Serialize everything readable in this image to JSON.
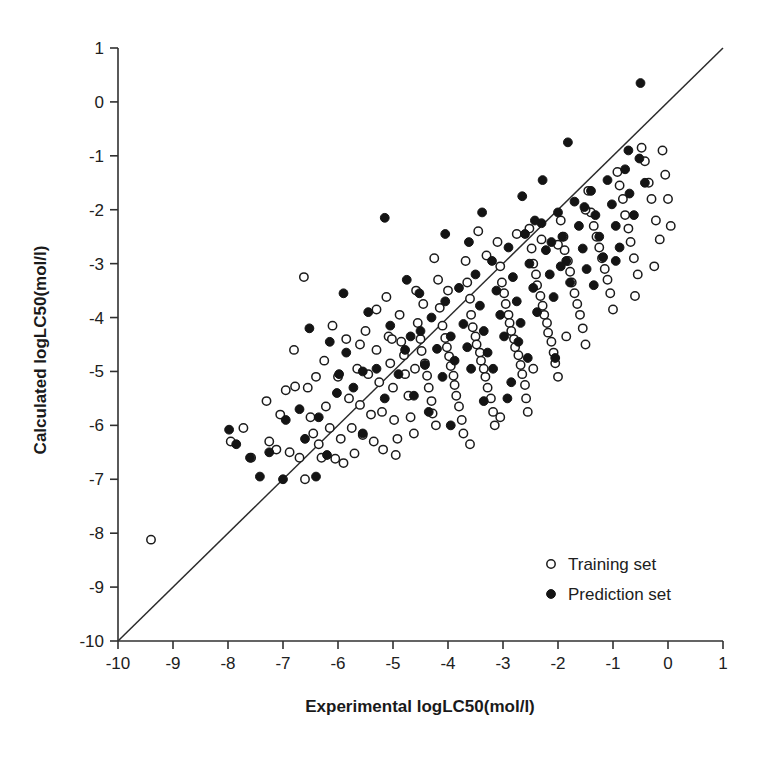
{
  "chart_data": {
    "type": "scatter",
    "title": "",
    "xlabel": "Experimental logLC50(mol/l)",
    "ylabel": "Calculated logLC50(mol/l)",
    "xlim": [
      -10,
      1
    ],
    "ylim": [
      -10,
      1
    ],
    "xticks": [
      -10,
      -9,
      -8,
      -7,
      -6,
      -5,
      -4,
      -3,
      -2,
      -1,
      0,
      1
    ],
    "yticks": [
      1,
      0,
      -1,
      -2,
      -3,
      -4,
      -5,
      -6,
      -7,
      -8,
      -9,
      -10
    ],
    "xtick_labels": [
      "-10",
      "-9",
      "-8",
      "-7",
      "-6",
      "-5",
      "-4",
      "-3",
      "-2",
      "-1",
      "0",
      "1"
    ],
    "ytick_labels": [
      "1",
      "0",
      "-1",
      "-2",
      "-3",
      "-4",
      "-5",
      "-6",
      "-7",
      "-8",
      "-9",
      "-10"
    ],
    "grid": false,
    "legend_position": "lower-right",
    "reference_line": {
      "name": "identity-line",
      "from": [
        -10,
        -10
      ],
      "to": [
        1,
        1
      ],
      "color": "#2b2b2b"
    },
    "series": [
      {
        "name": "Training set",
        "marker": "open-circle",
        "color": "#ffffff",
        "edge_color": "#1b1b1b",
        "points": [
          [
            -9.4,
            -8.12
          ],
          [
            -7.95,
            -6.3
          ],
          [
            -7.72,
            -6.05
          ],
          [
            -7.58,
            -6.6
          ],
          [
            -7.3,
            -5.55
          ],
          [
            -7.25,
            -6.3
          ],
          [
            -7.12,
            -6.45
          ],
          [
            -6.95,
            -5.35
          ],
          [
            -6.88,
            -6.5
          ],
          [
            -6.78,
            -5.28
          ],
          [
            -6.7,
            -6.6
          ],
          [
            -6.62,
            -3.25
          ],
          [
            -6.55,
            -5.3
          ],
          [
            -6.5,
            -5.85
          ],
          [
            -6.45,
            -6.15
          ],
          [
            -6.4,
            -5.1
          ],
          [
            -6.35,
            -6.35
          ],
          [
            -6.3,
            -6.6
          ],
          [
            -6.22,
            -5.65
          ],
          [
            -6.15,
            -6.05
          ],
          [
            -6.1,
            -4.15
          ],
          [
            -6.05,
            -6.62
          ],
          [
            -6.0,
            -5.1
          ],
          [
            -5.95,
            -6.25
          ],
          [
            -5.9,
            -6.7
          ],
          [
            -5.85,
            -4.4
          ],
          [
            -5.8,
            -5.5
          ],
          [
            -5.75,
            -6.05
          ],
          [
            -5.7,
            -6.52
          ],
          [
            -5.65,
            -4.95
          ],
          [
            -5.6,
            -5.62
          ],
          [
            -5.55,
            -6.18
          ],
          [
            -5.5,
            -4.25
          ],
          [
            -5.45,
            -5.05
          ],
          [
            -5.4,
            -5.8
          ],
          [
            -5.35,
            -6.3
          ],
          [
            -5.3,
            -4.6
          ],
          [
            -5.25,
            -5.2
          ],
          [
            -5.2,
            -5.75
          ],
          [
            -5.18,
            -6.45
          ],
          [
            -5.12,
            -3.62
          ],
          [
            -5.08,
            -4.35
          ],
          [
            -5.05,
            -4.85
          ],
          [
            -5.0,
            -5.3
          ],
          [
            -4.98,
            -5.9
          ],
          [
            -4.92,
            -6.25
          ],
          [
            -4.88,
            -3.95
          ],
          [
            -4.85,
            -4.45
          ],
          [
            -4.8,
            -4.7
          ],
          [
            -4.78,
            -5.05
          ],
          [
            -4.72,
            -5.45
          ],
          [
            -4.68,
            -5.85
          ],
          [
            -4.62,
            -6.15
          ],
          [
            -4.58,
            -3.5
          ],
          [
            -4.55,
            -4.1
          ],
          [
            -4.5,
            -4.4
          ],
          [
            -4.48,
            -4.62
          ],
          [
            -4.42,
            -4.85
          ],
          [
            -4.38,
            -5.08
          ],
          [
            -4.35,
            -5.3
          ],
          [
            -4.3,
            -5.55
          ],
          [
            -4.28,
            -5.78
          ],
          [
            -4.22,
            -6.0
          ],
          [
            -4.18,
            -3.3
          ],
          [
            -4.15,
            -3.82
          ],
          [
            -4.1,
            -4.15
          ],
          [
            -4.05,
            -4.38
          ],
          [
            -4.02,
            -4.55
          ],
          [
            -3.98,
            -4.72
          ],
          [
            -3.95,
            -4.9
          ],
          [
            -3.9,
            -5.08
          ],
          [
            -3.88,
            -5.25
          ],
          [
            -3.85,
            -5.45
          ],
          [
            -3.8,
            -5.65
          ],
          [
            -3.75,
            -5.9
          ],
          [
            -3.72,
            -6.15
          ],
          [
            -3.68,
            -2.95
          ],
          [
            -3.65,
            -3.35
          ],
          [
            -3.6,
            -3.65
          ],
          [
            -3.58,
            -3.95
          ],
          [
            -3.55,
            -4.18
          ],
          [
            -3.5,
            -4.35
          ],
          [
            -3.48,
            -4.5
          ],
          [
            -3.42,
            -4.65
          ],
          [
            -3.4,
            -4.8
          ],
          [
            -3.35,
            -4.95
          ],
          [
            -3.32,
            -5.1
          ],
          [
            -3.28,
            -5.3
          ],
          [
            -3.22,
            -5.5
          ],
          [
            -3.18,
            -5.75
          ],
          [
            -3.15,
            -6.0
          ],
          [
            -3.1,
            -2.6
          ],
          [
            -3.05,
            -3.05
          ],
          [
            -3.02,
            -3.35
          ],
          [
            -2.98,
            -3.55
          ],
          [
            -2.95,
            -3.75
          ],
          [
            -2.9,
            -3.95
          ],
          [
            -2.88,
            -4.1
          ],
          [
            -2.85,
            -4.25
          ],
          [
            -2.8,
            -4.4
          ],
          [
            -2.78,
            -4.55
          ],
          [
            -2.72,
            -4.7
          ],
          [
            -2.68,
            -4.88
          ],
          [
            -2.65,
            -5.05
          ],
          [
            -2.6,
            -5.25
          ],
          [
            -2.58,
            -5.5
          ],
          [
            -2.52,
            -2.35
          ],
          [
            -2.48,
            -2.72
          ],
          [
            -2.45,
            -3.0
          ],
          [
            -2.4,
            -3.2
          ],
          [
            -2.38,
            -3.4
          ],
          [
            -2.32,
            -3.6
          ],
          [
            -2.28,
            -3.78
          ],
          [
            -2.25,
            -3.95
          ],
          [
            -2.2,
            -4.1
          ],
          [
            -2.18,
            -4.28
          ],
          [
            -2.12,
            -4.45
          ],
          [
            -2.08,
            -4.65
          ],
          [
            -2.05,
            -4.85
          ],
          [
            -2.0,
            -5.1
          ],
          [
            -1.95,
            -2.2
          ],
          [
            -1.9,
            -2.5
          ],
          [
            -1.88,
            -2.75
          ],
          [
            -1.82,
            -2.95
          ],
          [
            -1.78,
            -3.15
          ],
          [
            -1.75,
            -3.35
          ],
          [
            -1.7,
            -3.55
          ],
          [
            -1.65,
            -3.75
          ],
          [
            -1.6,
            -3.95
          ],
          [
            -1.55,
            -4.2
          ],
          [
            -1.5,
            -4.5
          ],
          [
            -1.45,
            -1.65
          ],
          [
            -1.4,
            -2.05
          ],
          [
            -1.35,
            -2.3
          ],
          [
            -1.3,
            -2.5
          ],
          [
            -1.25,
            -2.7
          ],
          [
            -1.2,
            -2.9
          ],
          [
            -1.15,
            -3.1
          ],
          [
            -1.1,
            -3.3
          ],
          [
            -1.05,
            -3.55
          ],
          [
            -1.0,
            -3.85
          ],
          [
            -0.92,
            -1.3
          ],
          [
            -0.88,
            -1.55
          ],
          [
            -0.82,
            -1.8
          ],
          [
            -0.78,
            -2.1
          ],
          [
            -0.72,
            -2.35
          ],
          [
            -0.68,
            -2.6
          ],
          [
            -0.62,
            -2.9
          ],
          [
            -0.55,
            -3.2
          ],
          [
            -0.48,
            -0.85
          ],
          [
            -0.42,
            -1.1
          ],
          [
            -0.35,
            -1.5
          ],
          [
            -0.3,
            -1.8
          ],
          [
            -0.22,
            -2.2
          ],
          [
            -0.15,
            -2.55
          ],
          [
            -0.1,
            -0.9
          ],
          [
            -0.05,
            -1.35
          ],
          [
            0.0,
            -1.8
          ],
          [
            0.05,
            -2.3
          ],
          [
            -0.25,
            -3.05
          ],
          [
            -0.6,
            -3.6
          ],
          [
            -2.3,
            -2.55
          ],
          [
            -2.75,
            -2.45
          ],
          [
            -3.3,
            -2.85
          ],
          [
            -4.6,
            -4.95
          ],
          [
            -5.02,
            -4.4
          ],
          [
            -5.6,
            -4.5
          ],
          [
            -6.25,
            -4.8
          ],
          [
            -3.05,
            -5.85
          ],
          [
            -2.55,
            -5.75
          ],
          [
            -2.0,
            -2.65
          ],
          [
            -1.5,
            -2.0
          ],
          [
            -4.45,
            -3.75
          ],
          [
            -4.0,
            -3.5
          ],
          [
            -3.45,
            -2.4
          ],
          [
            -6.8,
            -4.6
          ],
          [
            -5.3,
            -3.85
          ],
          [
            -4.25,
            -2.9
          ],
          [
            -2.45,
            -4.95
          ],
          [
            -1.85,
            -4.35
          ],
          [
            -3.6,
            -6.35
          ],
          [
            -4.95,
            -6.55
          ],
          [
            -6.6,
            -7.0
          ],
          [
            -7.05,
            -5.8
          ]
        ]
      },
      {
        "name": "Prediction set",
        "marker": "filled-circle",
        "color": "#141414",
        "edge_color": "#141414",
        "points": [
          [
            -7.98,
            -6.08
          ],
          [
            -7.85,
            -6.35
          ],
          [
            -7.42,
            -6.95
          ],
          [
            -7.0,
            -7.0
          ],
          [
            -6.95,
            -5.9
          ],
          [
            -6.6,
            -6.25
          ],
          [
            -6.52,
            -4.2
          ],
          [
            -6.4,
            -6.95
          ],
          [
            -6.2,
            -6.55
          ],
          [
            -6.02,
            -5.4
          ],
          [
            -5.9,
            -3.55
          ],
          [
            -5.72,
            -5.3
          ],
          [
            -5.55,
            -6.15
          ],
          [
            -5.3,
            -4.95
          ],
          [
            -5.15,
            -5.5
          ],
          [
            -5.05,
            -4.15
          ],
          [
            -4.9,
            -5.05
          ],
          [
            -4.78,
            -4.6
          ],
          [
            -4.62,
            -5.45
          ],
          [
            -4.5,
            -4.25
          ],
          [
            -4.42,
            -4.88
          ],
          [
            -4.3,
            -4.0
          ],
          [
            -4.2,
            -4.58
          ],
          [
            -4.1,
            -5.1
          ],
          [
            -4.05,
            -3.7
          ],
          [
            -3.95,
            -4.35
          ],
          [
            -3.88,
            -4.8
          ],
          [
            -3.8,
            -3.45
          ],
          [
            -3.72,
            -4.12
          ],
          [
            -3.65,
            -4.55
          ],
          [
            -3.58,
            -4.95
          ],
          [
            -3.5,
            -3.2
          ],
          [
            -3.42,
            -3.78
          ],
          [
            -3.35,
            -4.25
          ],
          [
            -3.28,
            -4.65
          ],
          [
            -3.2,
            -2.95
          ],
          [
            -3.12,
            -3.5
          ],
          [
            -3.05,
            -3.95
          ],
          [
            -2.98,
            -4.35
          ],
          [
            -2.9,
            -2.7
          ],
          [
            -2.82,
            -3.25
          ],
          [
            -2.75,
            -3.7
          ],
          [
            -2.68,
            -4.1
          ],
          [
            -2.6,
            -2.45
          ],
          [
            -2.52,
            -3.0
          ],
          [
            -2.45,
            -3.45
          ],
          [
            -2.38,
            -3.9
          ],
          [
            -2.3,
            -2.25
          ],
          [
            -2.22,
            -2.75
          ],
          [
            -2.15,
            -3.2
          ],
          [
            -2.08,
            -3.62
          ],
          [
            -2.0,
            -2.05
          ],
          [
            -1.92,
            -2.5
          ],
          [
            -1.85,
            -2.95
          ],
          [
            -1.78,
            -3.35
          ],
          [
            -1.7,
            -1.85
          ],
          [
            -1.62,
            -2.3
          ],
          [
            -1.55,
            -2.72
          ],
          [
            -1.48,
            -3.1
          ],
          [
            -1.4,
            -1.65
          ],
          [
            -1.32,
            -2.1
          ],
          [
            -1.25,
            -2.5
          ],
          [
            -1.18,
            -2.88
          ],
          [
            -1.1,
            -1.45
          ],
          [
            -1.02,
            -1.9
          ],
          [
            -0.95,
            -2.3
          ],
          [
            -0.88,
            -2.7
          ],
          [
            -0.78,
            -1.25
          ],
          [
            -0.7,
            -1.7
          ],
          [
            -0.62,
            -2.1
          ],
          [
            -0.52,
            -1.05
          ],
          [
            -0.42,
            -1.5
          ],
          [
            -0.5,
            0.35
          ],
          [
            -1.82,
            -0.75
          ],
          [
            -2.28,
            -1.45
          ],
          [
            -2.65,
            -1.75
          ],
          [
            -3.38,
            -2.05
          ],
          [
            -5.15,
            -2.15
          ],
          [
            -4.05,
            -2.45
          ],
          [
            -2.85,
            -5.2
          ],
          [
            -3.35,
            -5.55
          ],
          [
            -2.55,
            -4.75
          ],
          [
            -4.75,
            -3.3
          ],
          [
            -5.45,
            -3.9
          ],
          [
            -6.15,
            -4.45
          ],
          [
            -5.85,
            -4.65
          ],
          [
            -4.35,
            -5.75
          ],
          [
            -3.95,
            -6.0
          ],
          [
            -5.55,
            -5.0
          ],
          [
            -6.7,
            -5.7
          ],
          [
            -7.25,
            -6.5
          ],
          [
            -2.12,
            -2.6
          ],
          [
            -1.95,
            -3.05
          ],
          [
            -2.42,
            -2.2
          ],
          [
            -3.62,
            -2.6
          ],
          [
            -4.52,
            -3.55
          ],
          [
            -1.35,
            -3.4
          ],
          [
            -0.95,
            -2.95
          ],
          [
            -2.72,
            -4.45
          ],
          [
            -3.18,
            -4.95
          ],
          [
            -4.68,
            -4.35
          ],
          [
            -5.98,
            -5.05
          ],
          [
            -6.35,
            -5.85
          ],
          [
            -7.6,
            -6.6
          ],
          [
            -1.52,
            -1.95
          ],
          [
            -0.72,
            -0.9
          ],
          [
            -2.05,
            -4.75
          ],
          [
            -2.92,
            -5.5
          ]
        ]
      }
    ]
  },
  "legend": {
    "items": [
      {
        "label": "Training set",
        "marker": "open-circle"
      },
      {
        "label": "Prediction set",
        "marker": "filled-circle"
      }
    ]
  },
  "colors": {
    "axis": "#303030",
    "line": "#2b2b2b",
    "marker_fill": "#141414",
    "marker_edge": "#1b1b1b",
    "background": "#ffffff"
  }
}
